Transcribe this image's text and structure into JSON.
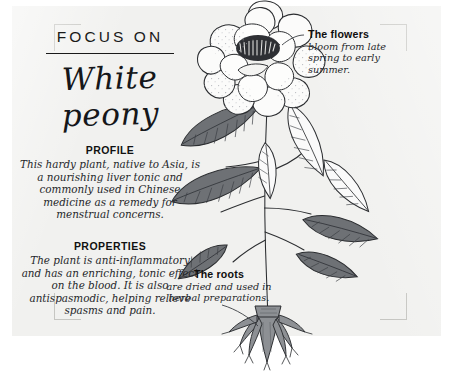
{
  "card": {
    "eyebrow": "FOCUS ON",
    "title": "White peony"
  },
  "sections": [
    {
      "heading": "PROFILE",
      "body": "This hardy plant, native to Asia, is a nourishing liver tonic and commonly used in Chinese medicine as a remedy for menstrual concerns."
    },
    {
      "heading": "PROPERTIES",
      "body": "The plant is anti-inflammatory and has an enriching, tonic effect on the blood. It is also antispasmodic, helping relieve spasms and pain."
    }
  ],
  "annotations": [
    {
      "title": "The flowers",
      "body": "bloom from late spring to early summer."
    },
    {
      "title": "The roots",
      "body": "are dried and used in herbal preparations."
    }
  ],
  "illustration": {
    "subject": "white-peony-plant",
    "parts": [
      "flower-bloom",
      "stem",
      "leaves",
      "root-crown"
    ]
  },
  "colors": {
    "card_background": "#f1f1ef",
    "page_background": "#ffffff",
    "ink": "#1a1a1a",
    "leaf_fill": "#6e7175",
    "root_fill": "#8d9094",
    "bracket": "#c6c6c2"
  }
}
